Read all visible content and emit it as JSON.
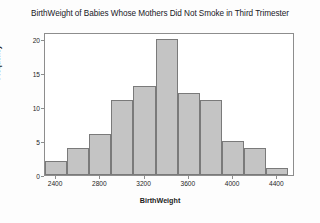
{
  "chart_data": {
    "type": "bar",
    "title": "BirthWeight of Babies Whose Mothers Did Not Smoke in Third Trimester",
    "xlabel": "BirthWeight",
    "ylabel": "Frequency",
    "categories": [
      "2300",
      "2500",
      "2700",
      "2900",
      "3100",
      "3300",
      "3500",
      "3700",
      "3900",
      "4100",
      "4300"
    ],
    "bin_edges": [
      2300,
      2500,
      2700,
      2900,
      3100,
      3300,
      3500,
      3700,
      3900,
      4100,
      4300,
      4500
    ],
    "bin_width": 200,
    "values": [
      2,
      4,
      6,
      11,
      13,
      20,
      12,
      11,
      5,
      4,
      1
    ],
    "xlim": [
      2300,
      4560
    ],
    "ylim": [
      0,
      21
    ],
    "x_ticks": [
      2400,
      2800,
      3200,
      3600,
      4000,
      4400
    ],
    "x_tick_labels": [
      "2400",
      "2800",
      "3200",
      "3600",
      "4000",
      "4400"
    ],
    "y_ticks": [
      0,
      5,
      10,
      15,
      20
    ],
    "y_tick_labels": [
      "0",
      "5",
      "10",
      "15",
      "20"
    ],
    "grid": false,
    "legend": "none",
    "bar_color": "#c4c4c4",
    "bar_edge_color": "#7a7a7a",
    "plot_background": "#ffffff",
    "frame_color": "#8d8d8d"
  }
}
